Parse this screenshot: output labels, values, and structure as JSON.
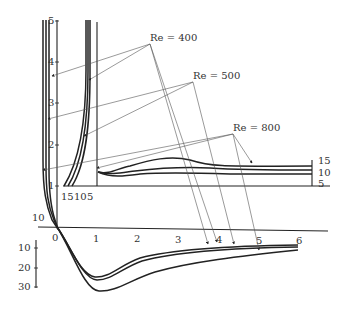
{
  "figure": {
    "type": "velocity-profile-diagram",
    "annotations": [
      {
        "label": "Re = 400",
        "x": 180,
        "y": 41
      },
      {
        "label": "Re = 500",
        "x": 200,
        "y": 79
      },
      {
        "label": "Re = 800",
        "x": 233,
        "y": 131
      }
    ],
    "left_vertical_axis": {
      "ticks": [
        "1",
        "2",
        "3",
        "4",
        "5"
      ],
      "extra_label": "10"
    },
    "inner_profile_axis": {
      "ticks": [
        "15",
        "10",
        "5"
      ]
    },
    "right_scale": {
      "ticks": [
        "15",
        "10",
        "5"
      ]
    },
    "bottom_horizontal_axis": {
      "ticks": [
        "0",
        "1",
        "2",
        "3",
        "4",
        "5",
        "6"
      ]
    },
    "bottom_vertical_axis": {
      "ticks": [
        "10",
        "20",
        "30"
      ]
    },
    "colors": {
      "line": "#222222",
      "leader": "#555555",
      "background": "#ffffff"
    }
  }
}
